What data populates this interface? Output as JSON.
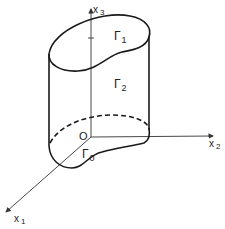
{
  "diagram": {
    "type": "3d-cylinder-domain",
    "axes": {
      "x1": {
        "label": "x",
        "subscript": "1"
      },
      "x2": {
        "label": "x",
        "subscript": "2"
      },
      "x3": {
        "label": "x",
        "subscript": "3"
      }
    },
    "origin_label": "O",
    "boundaries": [
      {
        "name": "Γ",
        "subscript": "1",
        "description": "top surface"
      },
      {
        "name": "Γ",
        "subscript": "2",
        "description": "lateral surface"
      },
      {
        "name": "Γ",
        "subscript": "0",
        "description": "bottom surface"
      }
    ],
    "colors": {
      "stroke": "#1a1a1a",
      "axis": "#333333",
      "background": "#ffffff"
    }
  }
}
